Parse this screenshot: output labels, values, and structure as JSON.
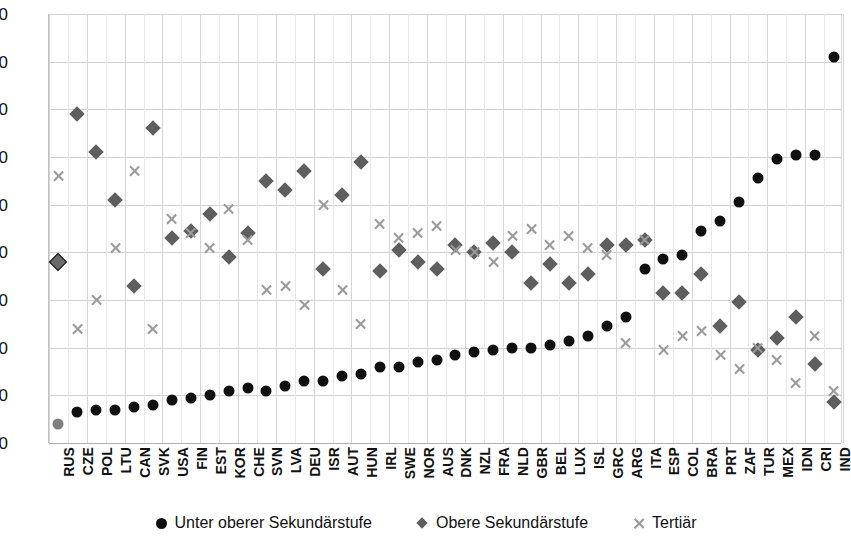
{
  "chart_data": {
    "type": "scatter",
    "title": "",
    "xlabel": "",
    "ylabel": "",
    "ylim": [
      0,
      90
    ],
    "ytick_step": 10,
    "yticks": [
      90,
      80,
      70,
      60,
      50,
      40,
      30,
      20,
      10,
      0
    ],
    "grid": true,
    "legend_position": "bottom",
    "categories": [
      "RUS",
      "CZE",
      "POL",
      "LTU",
      "CAN",
      "SVK",
      "USA",
      "FIN",
      "EST",
      "KOR",
      "CHE",
      "SVN",
      "LVA",
      "DEU",
      "ISR",
      "AUT",
      "HUN",
      "IRL",
      "SWE",
      "NOR",
      "AUS",
      "DNK",
      "NZL",
      "FRA",
      "NLD",
      "GBR",
      "BEL",
      "LUX",
      "ISL",
      "GRC",
      "ARG",
      "ITA",
      "ESP",
      "COL",
      "BRA",
      "PRT",
      "ZAF",
      "TUR",
      "MEX",
      "IDN",
      "CRI",
      "IND"
    ],
    "series": [
      {
        "name": "Unter oberer Sekundärstufe",
        "marker": "circle",
        "color": "#101010",
        "values": [
          4.0,
          6.5,
          7.0,
          7.0,
          7.5,
          8.0,
          9.0,
          9.5,
          10.0,
          11.0,
          11.5,
          11.0,
          12.0,
          13.0,
          13.0,
          14.0,
          14.5,
          16.0,
          16.0,
          17.0,
          17.5,
          18.5,
          19.0,
          19.5,
          20.0,
          20.0,
          20.5,
          21.5,
          22.5,
          24.5,
          26.5,
          36.5,
          38.5,
          39.5,
          44.5,
          46.5,
          50.5,
          55.5,
          59.5,
          60.5,
          60.5,
          81.0
        ]
      },
      {
        "name": "Obere Sekundärstufe",
        "marker": "diamond",
        "color": "#5e5e5e",
        "values": [
          38.0,
          69.0,
          61.0,
          51.0,
          33.0,
          66.0,
          43.0,
          44.5,
          48.0,
          39.0,
          44.0,
          55.0,
          53.0,
          57.0,
          36.5,
          52.0,
          59.0,
          36.0,
          40.5,
          38.0,
          36.5,
          41.5,
          40.0,
          42.0,
          40.0,
          33.5,
          37.5,
          33.5,
          35.5,
          41.5,
          41.5,
          42.5,
          31.5,
          31.5,
          35.5,
          24.5,
          29.5,
          19.5,
          22.0,
          26.5,
          16.5,
          8.5
        ]
      },
      {
        "name": "Tertiär",
        "marker": "cross",
        "color": "#9a9a9a",
        "values": [
          56.0,
          24.0,
          30.0,
          41.0,
          57.0,
          24.0,
          47.0,
          44.0,
          41.0,
          49.0,
          42.5,
          32.0,
          33.0,
          29.0,
          50.0,
          32.0,
          25.0,
          46.0,
          43.0,
          44.0,
          45.5,
          40.5,
          40.0,
          38.0,
          43.5,
          45.0,
          41.5,
          43.5,
          41.0,
          39.5,
          21.0,
          42.5,
          19.5,
          22.5,
          23.5,
          18.5,
          15.5,
          20.0,
          17.5,
          12.5,
          22.5,
          11.0
        ]
      }
    ]
  },
  "legend": {
    "items": [
      {
        "label": "Unter oberer Sekundärstufe",
        "marker": "circle"
      },
      {
        "label": "Obere Sekundärstufe",
        "marker": "diamond"
      },
      {
        "label": "Tertiär",
        "marker": "cross"
      }
    ]
  },
  "colors": {
    "primary": "#101010",
    "secondary": "#5e5e5e",
    "tertiary": "#9a9a9a",
    "grid": "#d0d0d0",
    "background": "#ffffff"
  }
}
